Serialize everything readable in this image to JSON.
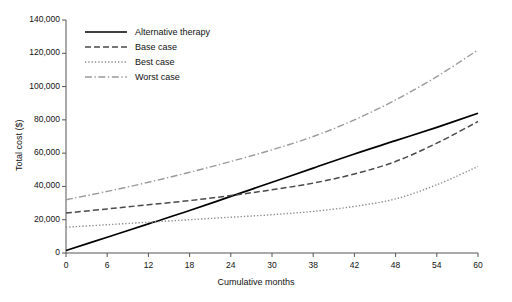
{
  "chart_data": {
    "type": "line",
    "title": "",
    "xlabel": "Cumulative months",
    "ylabel": "Total cost ($)",
    "xlim": [
      0,
      60
    ],
    "ylim": [
      0,
      140000
    ],
    "grid": false,
    "legend_position": "top-left-inside",
    "x_tick_labels": [
      "0",
      "6",
      "12",
      "18",
      "24",
      "30",
      "38",
      "42",
      "48",
      "54",
      "60"
    ],
    "x_tick_values": [
      0,
      6,
      12,
      18,
      24,
      30,
      36,
      42,
      48,
      54,
      60
    ],
    "y_tick_labels": [
      "0",
      "20,000",
      "40,000",
      "60,000",
      "80,000",
      "100,000",
      "120,000",
      "140,000"
    ],
    "y_tick_values": [
      0,
      20000,
      40000,
      60000,
      80000,
      100000,
      120000,
      140000
    ],
    "x": [
      0,
      6,
      12,
      18,
      24,
      30,
      36,
      42,
      48,
      54,
      60
    ],
    "series": [
      {
        "name": "Alternative therapy",
        "style": "solid",
        "color": "#000000",
        "values": [
          1500,
          9500,
          17500,
          25500,
          34000,
          42500,
          51000,
          59500,
          67500,
          75500,
          84000
        ]
      },
      {
        "name": "Base case",
        "style": "dashed",
        "color": "#4a4a4a",
        "values": [
          24000,
          26500,
          29000,
          31500,
          34500,
          38000,
          42000,
          47500,
          55000,
          66000,
          79000
        ]
      },
      {
        "name": "Best case",
        "style": "dotted",
        "color": "#8a8a8a",
        "values": [
          15500,
          17000,
          18500,
          20000,
          21500,
          23000,
          25000,
          28000,
          32500,
          41000,
          52000
        ]
      },
      {
        "name": "Worst case",
        "style": "dashdot",
        "color": "#9a9a9a",
        "values": [
          32000,
          37000,
          42500,
          48500,
          55000,
          62000,
          70000,
          80000,
          92000,
          106000,
          122000
        ]
      }
    ]
  },
  "legend": {
    "items": [
      {
        "label": "Alternative therapy"
      },
      {
        "label": "Base case"
      },
      {
        "label": "Best case"
      },
      {
        "label": "Worst case"
      }
    ]
  }
}
